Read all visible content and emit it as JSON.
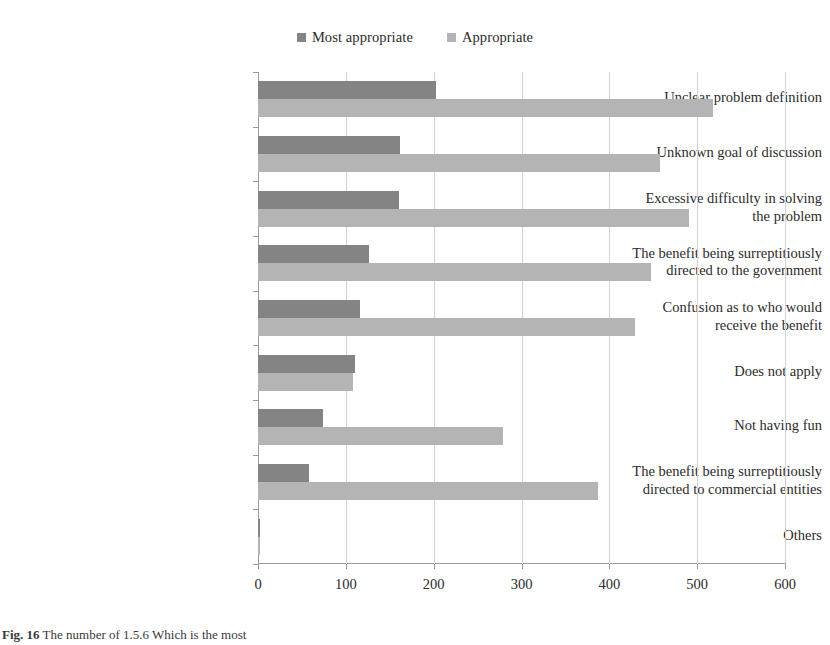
{
  "chart_data": {
    "type": "bar",
    "orientation": "horizontal",
    "title": "",
    "xlabel": "",
    "ylabel": "",
    "xlim": [
      0,
      600
    ],
    "xticks": [
      0,
      100,
      200,
      300,
      400,
      500,
      600
    ],
    "grid": "vertical",
    "legend_position": "top-center",
    "categories": [
      "Unclear problem definition",
      "Unknown goal of discussion",
      "Excessive difficulty in solving the problem",
      "The benefit being surreptitiously directed to the government",
      "Confusion as to who would receive the benefit",
      "Does not apply",
      "Not having fun",
      "The benefit being surreptitiously directed to commercial entities",
      "Others"
    ],
    "category_lines": [
      [
        "Unclear problem definition"
      ],
      [
        "Unknown goal of discussion"
      ],
      [
        "Excessive difficulty in solving",
        "the problem"
      ],
      [
        "The benefit being surreptitiously",
        "directed to the government"
      ],
      [
        "Confusion as to who would",
        "receive the benefit"
      ],
      [
        "Does not apply"
      ],
      [
        "Not having fun"
      ],
      [
        "The benefit being surreptitiously",
        "directed to commercial entities"
      ],
      [
        "Others"
      ]
    ],
    "series": [
      {
        "name": "Most appropriate",
        "color": "#848484",
        "values": [
          203,
          162,
          160,
          126,
          116,
          111,
          74,
          58,
          2
        ]
      },
      {
        "name": "Appropriate",
        "color": "#b4b4b4",
        "values": [
          518,
          458,
          491,
          447,
          429,
          108,
          279,
          387,
          2
        ]
      }
    ]
  },
  "legend": {
    "entries": [
      {
        "label": "Most appropriate",
        "color": "#848484"
      },
      {
        "label": "Appropriate",
        "color": "#b4b4b4"
      }
    ]
  },
  "caption": {
    "figure_number": "Fig. 16",
    "text": "The number of 1.5.6 Which is the most"
  }
}
